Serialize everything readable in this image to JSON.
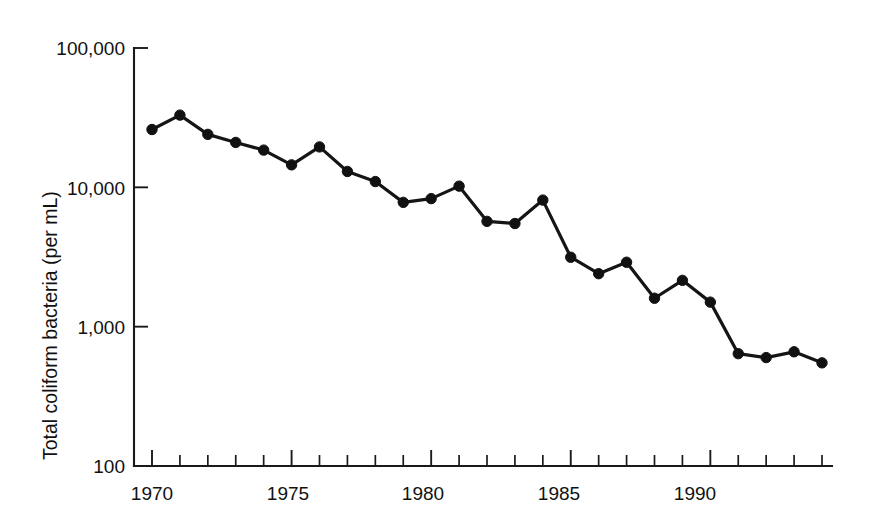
{
  "chart_data": {
    "type": "line",
    "title": "",
    "xlabel": "",
    "ylabel": "Total coliform bacteria (per mL)",
    "yscale": "log",
    "ylim": [
      100,
      100000
    ],
    "xlim": [
      1969.5,
      1994.5
    ],
    "grid": false,
    "legend": null,
    "y_tick_labels": [
      "100,000",
      "10,000",
      "1,000",
      "100"
    ],
    "y_tick_values": [
      100000,
      10000,
      1000,
      100
    ],
    "x_tick_labels": [
      "1970",
      "1975",
      "1980",
      "1985",
      "1990"
    ],
    "x_tick_values": [
      1970,
      1975,
      1980,
      1985,
      1990
    ],
    "x_minor_ticks": [
      1971,
      1972,
      1973,
      1974,
      1976,
      1977,
      1978,
      1979,
      1981,
      1982,
      1983,
      1984,
      1986,
      1987,
      1988,
      1989,
      1991,
      1992,
      1993,
      1994
    ],
    "marker": "filled-circle",
    "line_color": "#151515",
    "marker_color": "#111111",
    "x": [
      1970,
      1971,
      1972,
      1973,
      1974,
      1975,
      1976,
      1977,
      1978,
      1979,
      1980,
      1981,
      1982,
      1983,
      1984,
      1985,
      1986,
      1987,
      1988,
      1989,
      1990,
      1991,
      1992,
      1993,
      1994
    ],
    "values": [
      26000,
      33000,
      24000,
      21000,
      18500,
      14500,
      19500,
      13000,
      11000,
      7800,
      8300,
      10200,
      5700,
      5500,
      8100,
      3150,
      2400,
      2900,
      1600,
      2150,
      1500,
      640,
      600,
      660,
      550
    ],
    "series": [
      {
        "name": "Total coliform bacteria (per mL)",
        "values": [
          26000,
          33000,
          24000,
          21000,
          18500,
          14500,
          19500,
          13000,
          11000,
          7800,
          8300,
          10200,
          5700,
          5500,
          8100,
          3150,
          2400,
          2900,
          1600,
          2150,
          1500,
          640,
          600,
          660,
          550
        ]
      }
    ]
  },
  "axes": {
    "y_title": "Total coliform bacteria (per mL)",
    "y_labels": {
      "l0": "100,000",
      "l1": "10,000",
      "l2": "1,000",
      "l3": "100"
    },
    "x_labels": {
      "t0": "1970",
      "t1": "1975",
      "t2": "1980",
      "t3": "1985",
      "t4": "1990"
    }
  }
}
